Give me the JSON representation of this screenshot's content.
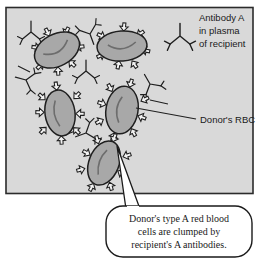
{
  "figure": {
    "type": "biology-diagram",
    "frame": {
      "background_color": "#d9d9d9",
      "border_color": "#2b2b2b"
    },
    "labels": {
      "antibody_legend": {
        "lines": [
          "Antibody A",
          "in plasma",
          "of recipient"
        ],
        "icon": "antibody-y-shape"
      },
      "rbc_pointer": {
        "text": "Donor's RBC"
      }
    },
    "callout": {
      "lines": [
        "Donor's type A red blood",
        "cells are clumped by",
        "recipient's A antibodies."
      ],
      "fill_color": "#ffffff",
      "border_color": "#1a1a1a"
    },
    "cells": {
      "fill_color": "#a8a8a8",
      "outline_color": "#1f1f1f",
      "count": 5,
      "antigen_shape": "open-arrowhead",
      "items": [
        {
          "name": "rbc-upper-left",
          "cx": 57,
          "cy": 50,
          "rx": 24,
          "ry": 16,
          "rotate": -28
        },
        {
          "name": "rbc-upper-right",
          "cx": 122,
          "cy": 46,
          "rx": 25,
          "ry": 15,
          "rotate": -4
        },
        {
          "name": "rbc-middle-left",
          "cx": 60,
          "cy": 113,
          "rx": 15,
          "ry": 23,
          "rotate": -8
        },
        {
          "name": "rbc-middle-right",
          "cx": 122,
          "cy": 110,
          "rx": 16,
          "ry": 24,
          "rotate": 10
        },
        {
          "name": "rbc-bottom",
          "cx": 104,
          "cy": 163,
          "rx": 15,
          "ry": 23,
          "rotate": 22
        }
      ]
    },
    "antibodies": {
      "color": "#1f1f1f",
      "shape": "y-fork",
      "count": 6
    }
  }
}
